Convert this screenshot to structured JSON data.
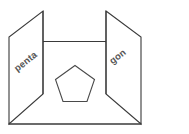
{
  "diagram": {
    "background_color": "#ffffff",
    "stroke_color": "#3a3a3a",
    "label_color": "#555555",
    "left_panel": {
      "label": "penta",
      "rotation_deg": -38
    },
    "right_panel": {
      "label": "gon",
      "rotation_deg": -38
    },
    "center_shape": {
      "name": "pentagon",
      "sides": 5,
      "label": ""
    }
  }
}
